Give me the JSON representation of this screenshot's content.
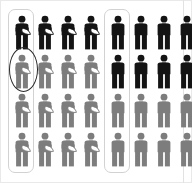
{
  "figure": {
    "background_color": "#ffffff",
    "width": 192,
    "height": 183
  },
  "colors": {
    "dark": "#141414",
    "gray": "#7d7d7d",
    "highlight_box_stroke": "#d2d2d2",
    "ellipse_stroke": "#2a2a2a",
    "bundle_fill": "#ffffff",
    "frame": "#e9e9e9"
  },
  "groups": [
    {
      "id": "left",
      "name": "parent-with-child-group",
      "icon": "person-carrying-baby-icon",
      "columns": 4,
      "rows": 4,
      "highlighted_column_index": 0,
      "highlight_shape": "rounded-rectangle",
      "circled_cell": {
        "row": 1,
        "column": 0,
        "shape": "ellipse"
      },
      "row_colors": [
        "dark",
        "gray",
        "gray",
        "gray"
      ],
      "counts": {
        "dark": 4,
        "gray": 12,
        "total": 16
      }
    },
    {
      "id": "right",
      "name": "person-group",
      "icon": "person-icon",
      "columns": 4,
      "rows": 4,
      "highlighted_column_index": 0,
      "highlight_shape": "rounded-rectangle",
      "circled_cell": null,
      "row_colors": [
        "dark",
        "dark",
        "gray",
        "gray"
      ],
      "counts": {
        "dark": 8,
        "gray": 8,
        "total": 16
      }
    }
  ],
  "annotations": {
    "column_highlight_label": "highlighted-column",
    "ellipse_label": "circled-figure"
  }
}
